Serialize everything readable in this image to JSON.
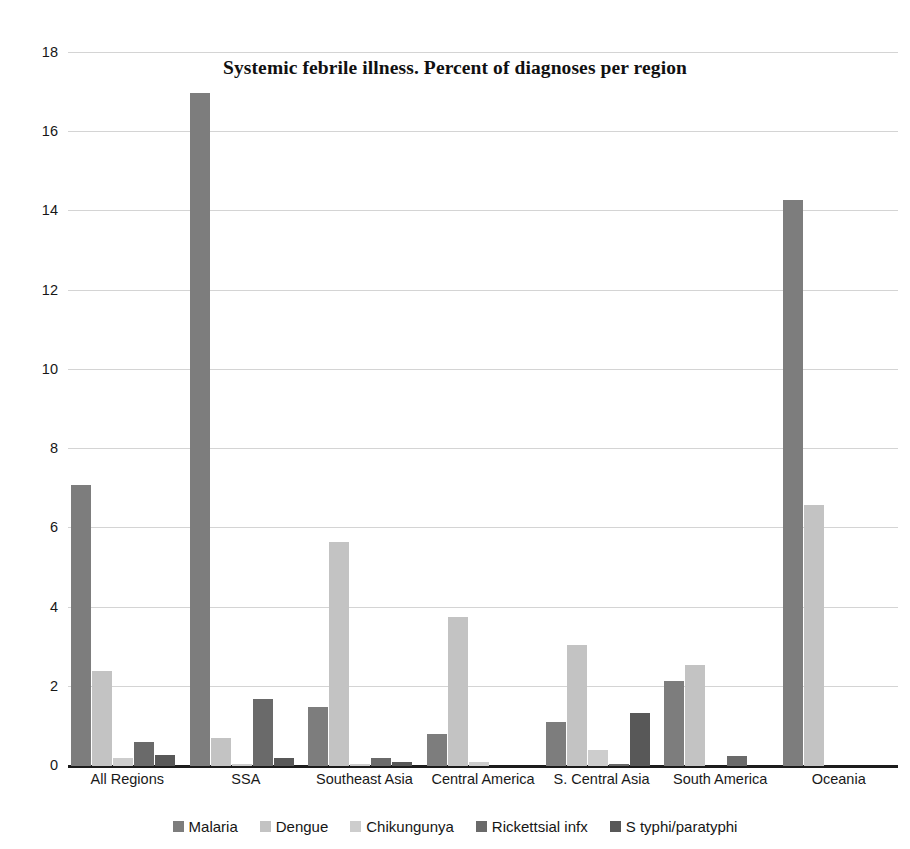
{
  "chart_data": {
    "type": "bar",
    "title": "Systemic febrile illness. Percent of diagnoses per region",
    "xlabel": "",
    "ylabel": "",
    "ylim": [
      0,
      18
    ],
    "yticks": [
      0,
      2,
      4,
      6,
      8,
      10,
      12,
      14,
      16,
      18
    ],
    "grid": true,
    "legend_position": "bottom",
    "categories": [
      "All Regions",
      "SSA",
      "Southeast Asia",
      "Central America",
      "S. Central Asia",
      "South America",
      "Oceania"
    ],
    "series": [
      {
        "name": "Malaria",
        "color": "#7d7d7d",
        "values": [
          7.1,
          17.0,
          1.5,
          0.8,
          1.1,
          2.15,
          14.3
        ]
      },
      {
        "name": "Dengue",
        "color": "#c3c3c3",
        "values": [
          2.4,
          0.7,
          5.65,
          3.75,
          3.05,
          2.55,
          6.6
        ]
      },
      {
        "name": "Chikungunya",
        "color": "#cdcdcd",
        "values": [
          0.2,
          0.05,
          0.05,
          0.1,
          0.4,
          0.0,
          0.0
        ]
      },
      {
        "name": "Rickettsial infx",
        "color": "#6a6a6a",
        "values": [
          0.6,
          1.7,
          0.2,
          0.0,
          0.05,
          0.25,
          0.0
        ]
      },
      {
        "name": "S typhi/paratyphi",
        "color": "#585858",
        "values": [
          0.28,
          0.2,
          0.1,
          0.0,
          1.35,
          0.0,
          0.0
        ]
      }
    ]
  }
}
